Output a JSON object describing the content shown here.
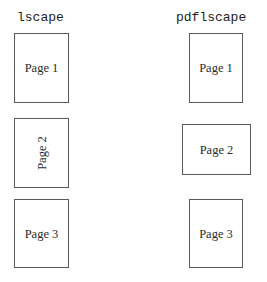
{
  "figure": {
    "caption_columns": [
      {
        "id": "lscape",
        "title": "lscape"
      },
      {
        "id": "pdflscape",
        "title": "pdflscape"
      }
    ],
    "colors": {
      "background": "#ffffff",
      "box_border": "#5a5a5a",
      "title_text": "#1d1d1d",
      "label_text": "#2b2b2b"
    }
  },
  "lscape_column": {
    "title": "lscape",
    "pages": [
      {
        "label": "Page 1",
        "orientation": "portrait",
        "text_rotation": "0deg"
      },
      {
        "label": "Page 2",
        "orientation": "portrait",
        "text_rotation": "-90deg"
      },
      {
        "label": "Page 3",
        "orientation": "portrait",
        "text_rotation": "0deg"
      }
    ]
  },
  "pdflscape_column": {
    "title": "pdflscape",
    "pages": [
      {
        "label": "Page 1",
        "orientation": "portrait",
        "text_rotation": "0deg"
      },
      {
        "label": "Page 2",
        "orientation": "landscape",
        "text_rotation": "0deg"
      },
      {
        "label": "Page 3",
        "orientation": "portrait",
        "text_rotation": "0deg"
      }
    ]
  }
}
